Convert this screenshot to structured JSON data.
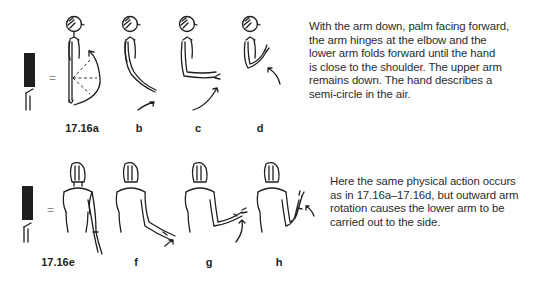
{
  "section_a": {
    "figure_label": "17.16a",
    "sub_labels": [
      "b",
      "c",
      "d"
    ],
    "equals_sign": "=",
    "description": "With the arm down, palm facing forward, the arm hinges at the elbow and the lower arm folds forward until the hand is close to the shoulder. The upper arm remains down. The hand describes a semi-circle in the air.",
    "description_lines": [
      "With the arm down, palm facing forward,",
      "the arm hinges at the elbow and the",
      "lower arm folds forward until the hand",
      "is close to the shoulder. The upper arm",
      "remains down. The hand describes a",
      "semi-circle in the air."
    ]
  },
  "section_e": {
    "figure_label": "17.16e",
    "sub_labels": [
      "f",
      "g",
      "h"
    ],
    "equals_sign": "=",
    "description": "Here the same physical action occurs as in 17.16a–17.16d, but outward arm rotation causes the lower arm to be carried out to the side.",
    "description_lines": [
      "Here the same physical action occurs",
      "as in 17.16a–17.16d, but outward arm",
      "rotation causes the lower arm to be",
      "carried out to the side."
    ]
  },
  "colors": {
    "ink": "#1f1f1f",
    "text": "#2b2b2b",
    "background": "#ffffff",
    "symbol_fill": "#231f20"
  }
}
